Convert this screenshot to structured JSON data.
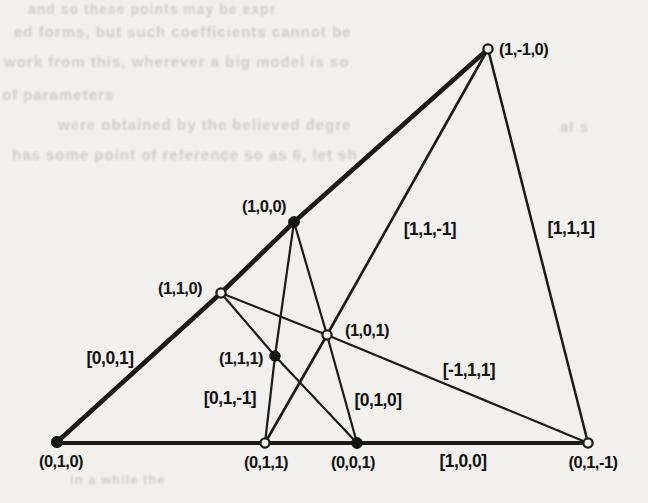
{
  "colors": {
    "paper": "#f1f0ec",
    "ink": "#1b1b1b",
    "bleed_text": "#c7c6c1"
  },
  "figure": {
    "points": [
      {
        "label": "(1,-1,0)",
        "marker": "open"
      },
      {
        "label": "(1,0,0)",
        "marker": "filled"
      },
      {
        "label": "(1,1,0)",
        "marker": "open"
      },
      {
        "label": "(1,1,1)",
        "marker": "filled"
      },
      {
        "label": "(1,0,1)",
        "marker": "open"
      },
      {
        "label": "(0,1,0)",
        "marker": "filled"
      },
      {
        "label": "(0,1,1)",
        "marker": "open"
      },
      {
        "label": "(0,0,1)",
        "marker": "filled"
      },
      {
        "label": "(0,1,-1)",
        "marker": "open"
      }
    ],
    "line_labels": [
      "[0,0,1]",
      "[1,1,-1]",
      "[1,1,1]",
      "[0,1,-1]",
      "[0,1,0]",
      "[-1,1,1]",
      "[1,0,0]"
    ]
  },
  "bleed_through": {
    "lines": [
      "and so these points may be expr",
      "ed forms, but such coefficients cannot be",
      "work from this, wherever a big model is so",
      "of parameters",
      "were obtained by the believed degre",
      "has some point of reference so as 6, let sh",
      "al s",
      "in a while the"
    ]
  }
}
